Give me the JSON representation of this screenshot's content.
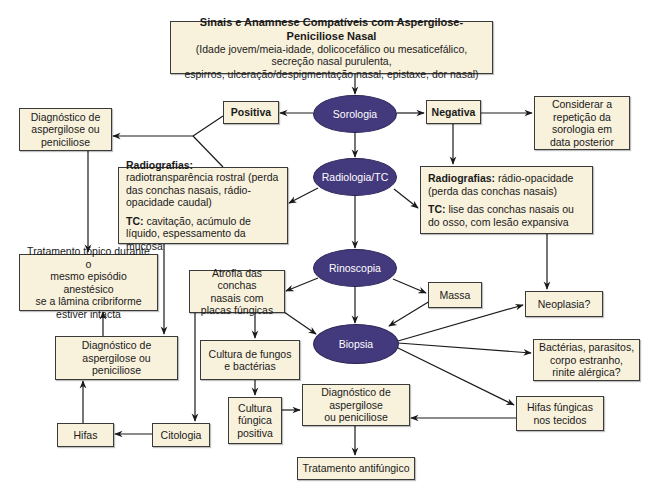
{
  "diagram": {
    "header": {
      "title": "Sinais e Anamnese Compatíveis com Aspergilose-Peniciliose Nasal",
      "line1": "(Idade jovem/meia-idade, dolicocefálico ou mesaticefálico, secreção nasal purulenta,",
      "line2": "espirros, ulceração/despigmentação nasal, epistaxe, dor nasal)"
    },
    "ellipses": {
      "sorologia": "Sorologia",
      "radiologia": "Radiologia/TC",
      "rinoscopia": "Rinoscopia",
      "biopsia": "Biopsia"
    },
    "boxes": {
      "positiva": "Positiva",
      "negativa": "Negativa",
      "considerar": [
        "Considerar a",
        "repetição da",
        "sorologia em",
        "data posterior"
      ],
      "diag_top": [
        "Diagnóstico de",
        "aspergilose ou",
        "peniciliose"
      ],
      "radio_left": {
        "rad_label": "Radiografias:",
        "rad_text": " radiotransparência rostral (perda das conchas nasais, rádio-opacidade caudal)",
        "tc_label": "TC:",
        "tc_text": " cavitação, acúmulo de líquido, espessamento da mucosa"
      },
      "radio_right": {
        "rad_label": "Radiografias:",
        "rad_text": " rádio-opacidade (perda das conchas nasais)",
        "tc_label": "TC:",
        "tc_text": " lise das conchas nasais ou do osso, com lesão expansiva"
      },
      "tratamento_topico": [
        "Tratamento tópico durante o",
        "mesmo episódio anestésico",
        "se a lâmina cribriforme",
        "estiver intacta"
      ],
      "atrofia": [
        "Atrofia das conchas",
        "nasais com",
        "placas fúngicas"
      ],
      "massa": "Massa",
      "neoplasia": "Neoplasia?",
      "diag_mid": [
        "Diagnóstico de",
        "aspergilose ou",
        "peniciliose"
      ],
      "cultura_fungos": [
        "Cultura de fungos",
        "e bactérias"
      ],
      "bacterias": [
        "Bactérias, parasitos,",
        "corpo estranho,",
        "rinite alérgica?"
      ],
      "cultura_positiva": [
        "Cultura",
        "fúngica",
        "positiva"
      ],
      "diag_center": [
        "Diagnóstico de",
        "aspergilose",
        "ou peniciliose"
      ],
      "hifas_fungicas": [
        "Hifas fúngicas",
        "nos tecidos"
      ],
      "hifas": "Hifas",
      "citologia": "Citologia",
      "tratamento_antifungico": "Tratamento antifúngico"
    },
    "colors": {
      "ellipse_fill": "#43397d",
      "box_fill": "#f8f1dc",
      "line": "#1a1a1a"
    }
  }
}
